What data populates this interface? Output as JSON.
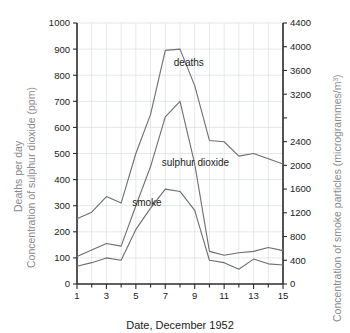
{
  "chart_data": {
    "type": "line",
    "title": "",
    "subtitle": "",
    "xlabel": "Date, December 1952",
    "ylabel": "Deaths per day\nConcentration of sulphur dioxide (ppm)",
    "ylabel_left_line1": "Deaths per day",
    "ylabel_left_line2": "Concentration of sulphur dioxide (ppm)",
    "ylabel_right": "Concentration of smoke particles (microgrammes/m3)",
    "ylabel_right_base": "Concentration of smoke particles (microgrammes/m",
    "ylabel_right_sup": "3",
    "ylabel_right_close": ")",
    "grid": true,
    "legend_position": "inline-annotations",
    "x": [
      1,
      2,
      3,
      4,
      5,
      6,
      7,
      8,
      9,
      10,
      11,
      12,
      13,
      14,
      15
    ],
    "xlim": [
      1,
      15
    ],
    "x_tick_labels": [
      "1",
      "3",
      "5",
      "7",
      "9",
      "11",
      "13",
      "15"
    ],
    "x_tick_values": [
      1,
      3,
      5,
      7,
      9,
      11,
      13,
      15
    ],
    "x_minor_ticks": [
      2,
      4,
      6,
      8,
      10,
      12,
      14
    ],
    "ylim_left": [
      0,
      1000
    ],
    "y_left_ticks": [
      0,
      100,
      200,
      300,
      400,
      500,
      600,
      700,
      800,
      900,
      1000
    ],
    "y_left_tick_labels": [
      "0",
      "100",
      "200",
      "300",
      "400",
      "500",
      "600",
      "700",
      "800",
      "900",
      "1000"
    ],
    "ylim_right": [
      0,
      4400
    ],
    "y_right_ticks": [
      0,
      400,
      800,
      1200,
      1600,
      2000,
      2400,
      2800,
      3200,
      3600,
      4000,
      4400
    ],
    "y_right_tick_labels": [
      "0",
      "400",
      "800",
      "1200",
      "1600",
      "2000",
      "2400",
      "",
      "3200",
      "3600",
      "4000",
      "4400"
    ],
    "series": [
      {
        "name": "deaths",
        "axis": "left",
        "label": "deaths",
        "label_x": 8.6,
        "label_y": 835,
        "color": "#6e6e6e",
        "values": [
          250,
          275,
          335,
          310,
          500,
          650,
          895,
          900,
          760,
          550,
          545,
          490,
          500,
          480,
          460
        ]
      },
      {
        "name": "sulphur dioxide",
        "axis": "left",
        "label": "sulphur dioxide",
        "label_x": 9.05,
        "label_y": 452,
        "color": "#6e6e6e",
        "values": [
          105,
          130,
          155,
          145,
          300,
          450,
          640,
          700,
          460,
          125,
          110,
          120,
          125,
          140,
          128
        ]
      },
      {
        "name": "smoke",
        "axis": "right",
        "label": "smoke",
        "label_x": 5.75,
        "label_y": 1320,
        "color": "#6e6e6e",
        "values": [
          300,
          360,
          440,
          400,
          920,
          1280,
          1600,
          1560,
          1240,
          400,
          360,
          248,
          420,
          340,
          320
        ]
      }
    ]
  }
}
